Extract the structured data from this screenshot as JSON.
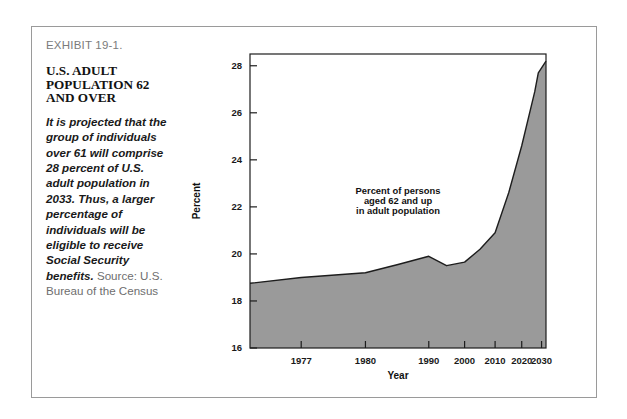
{
  "exhibit": {
    "number": "EXHIBIT 19-1.",
    "title_lines": [
      "U.S. ADULT",
      "POPULATION 62",
      "AND OVER"
    ],
    "body_italic": "It is projected that the group of individuals over 61 will comprise 28 percent of U.S. adult population in 2033. Thus, a larger percentage of individuals will be eligible to receive Social Security benefits.",
    "body_source": " Source: U.S. Bureau of the Census"
  },
  "chart_data": {
    "type": "area",
    "title": "",
    "xlabel": "Year",
    "ylabel": "Percent",
    "annotation": [
      "Percent of persons",
      "aged 62 and up",
      "in adult population"
    ],
    "grid": false,
    "legend": "none",
    "ylim": [
      16,
      28.5
    ],
    "yticks": [
      16,
      18,
      20,
      22,
      24,
      26,
      28
    ],
    "ytick_labels": [
      "16",
      "18",
      "20",
      "22",
      "24",
      "26",
      "28"
    ],
    "xticks": [
      1977,
      1980,
      1990,
      2000,
      2010,
      2020,
      2030
    ],
    "xtick_labels": [
      "1977",
      "1980",
      "1990",
      "2000",
      "2010",
      "2020",
      "2030"
    ],
    "x_axis_note": "non-linear spacing: 1975-1980 region expanded relative to later decades",
    "xtick_positions_frac": [
      0.173,
      0.39,
      0.604,
      0.725,
      0.828,
      0.918,
      0.985
    ],
    "series": [
      {
        "name": "Percent of persons aged 62 and up in adult population",
        "fill_color": "#9a9a9a",
        "line_color": "#1d1d1d",
        "x": [
          1975,
          1977,
          1980,
          1985,
          1990,
          1995,
          2000,
          2005,
          2010,
          2015,
          2020,
          2025,
          2027,
          2030
        ],
        "x_frac": [
          0.0,
          0.173,
          0.39,
          0.5,
          0.604,
          0.664,
          0.725,
          0.777,
          0.828,
          0.874,
          0.918,
          0.962,
          0.974,
          1.0
        ],
        "values": [
          18.75,
          19.0,
          19.2,
          19.55,
          19.9,
          19.5,
          19.65,
          20.2,
          20.9,
          22.6,
          24.6,
          26.9,
          27.7,
          28.2
        ]
      }
    ]
  }
}
